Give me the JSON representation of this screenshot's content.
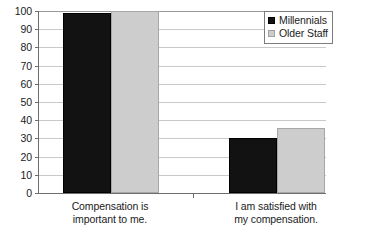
{
  "chart_data": {
    "type": "bar",
    "title": "",
    "subtitle": "",
    "xlabel": "",
    "ylabel": "",
    "ylim": [
      0,
      100
    ],
    "yticks": [
      0,
      10,
      20,
      30,
      40,
      50,
      60,
      70,
      80,
      90,
      100
    ],
    "ytick_labels": [
      "0",
      "10",
      "20",
      "30",
      "40",
      "50",
      "60",
      "70",
      "80",
      "90",
      "100"
    ],
    "grid": true,
    "legend_position": "top-right",
    "categories": [
      {
        "line1": "Compensation is",
        "line2": "important to me."
      },
      {
        "line1": "I am satisfied with",
        "line2": "my compensation."
      }
    ],
    "series": [
      {
        "name": "Millennials",
        "color": "#121212",
        "values": [
          99,
          30
        ]
      },
      {
        "name": "Older Staff",
        "color": "#cdcdcd",
        "values": [
          100,
          35.5
        ]
      }
    ]
  },
  "legend": {
    "items": [
      {
        "label": "Millennials",
        "swatch": "legend-swatch-black"
      },
      {
        "label": "Older Staff",
        "swatch": "legend-swatch-gray"
      }
    ]
  },
  "colors": {
    "series_millennials": "#121212",
    "series_older": "#cdcdcd",
    "gridline": "#c9c9c9",
    "axis": "#6e6e6e",
    "text": "#1b1b1b",
    "background": "#ffffff"
  }
}
